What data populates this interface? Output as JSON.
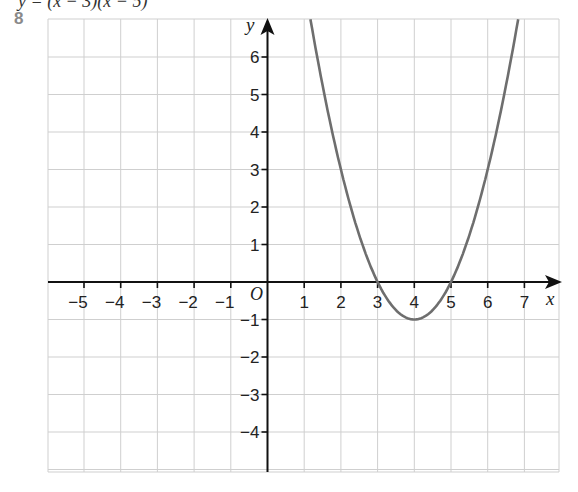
{
  "question": {
    "number": "8",
    "cut_off_text": "y = (x − 3)(x − 5)"
  },
  "chart_data": {
    "type": "line",
    "title": "",
    "function": "y = (x - 3)(x - 5)",
    "xlabel": "x",
    "ylabel": "y",
    "origin_label": "O",
    "xlim": [
      -5.9,
      7.9
    ],
    "ylim": [
      -5.1,
      7.0
    ],
    "grid": true,
    "x_ticks": [
      -5,
      -4,
      -3,
      -2,
      -1,
      1,
      2,
      3,
      4,
      5,
      6,
      7
    ],
    "x_tick_labels": [
      "−5",
      "−4",
      "−3",
      "−2",
      "−1",
      "1",
      "2",
      "3",
      "4",
      "5",
      "6",
      "7"
    ],
    "y_ticks": [
      6,
      5,
      4,
      3,
      2,
      1,
      -1,
      -2,
      -3,
      -4
    ],
    "y_tick_labels": [
      "6",
      "5",
      "4",
      "3",
      "2",
      "1",
      "−1",
      "−2",
      "−3",
      "−4"
    ],
    "series": [
      {
        "name": "parabola",
        "color": "#6e6e6e",
        "x": [
          1.17,
          1.5,
          2,
          2.5,
          3,
          3.5,
          4,
          4.5,
          5,
          5.5,
          6,
          6.5,
          6.83
        ],
        "y": [
          7.0,
          4.25,
          3,
          0.75,
          0,
          -0.75,
          -1,
          -0.75,
          0,
          0.75,
          3,
          4.25,
          7.0
        ]
      }
    ],
    "key_points": {
      "roots": [
        3,
        5
      ],
      "vertex": [
        4,
        -1
      ],
      "y_intercept": 15
    }
  },
  "colors": {
    "grid": "#cfcfcf",
    "axis": "#111111",
    "curve": "#6e6e6e",
    "question_number": "#8a8a8a"
  }
}
